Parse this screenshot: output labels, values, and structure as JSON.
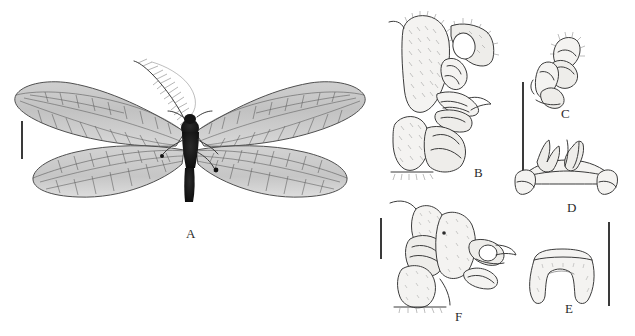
{
  "figure": {
    "background_color": "#ffffff",
    "ink_color": "#3b3b3b",
    "label_color": "#2b2b2b",
    "panels": [
      {
        "id": "A",
        "label": "A",
        "subject": "adult-habitus-dorsal",
        "x": 190,
        "y": 233
      },
      {
        "id": "B",
        "label": "B",
        "subject": "male-genitalia-lateral",
        "x": 478,
        "y": 172
      },
      {
        "id": "C",
        "label": "C",
        "subject": "gonocoxite-detail",
        "x": 565,
        "y": 113
      },
      {
        "id": "D",
        "label": "D",
        "subject": "gonarcus-ventral",
        "x": 571,
        "y": 207
      },
      {
        "id": "E",
        "label": "E",
        "subject": "ectoproct-ventral",
        "x": 569,
        "y": 308
      },
      {
        "id": "F",
        "label": "F",
        "subject": "male-genitalia-lateral-second",
        "x": 459,
        "y": 316
      }
    ],
    "scale_bars": [
      {
        "name": "scale-bar-a",
        "x": 21,
        "y": 121,
        "length": 38
      },
      {
        "name": "scale-bar-b",
        "x": 522,
        "y": 82,
        "length": 89
      },
      {
        "name": "scale-bar-f",
        "x": 380,
        "y": 218,
        "length": 41
      },
      {
        "name": "scale-bar-e",
        "x": 608,
        "y": 222,
        "length": 84
      }
    ]
  },
  "specimen": {
    "wing_tint": "#b9b9b9",
    "vein_color": "#4a4a4a",
    "body_color": "#121212",
    "antenna": "pectinate"
  }
}
